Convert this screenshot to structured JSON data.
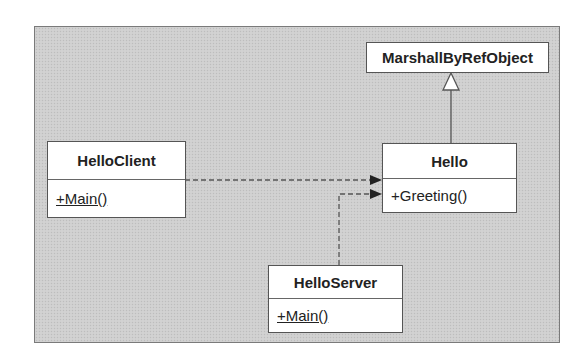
{
  "diagram": {
    "type": "uml-class-diagram",
    "background_color": "#cfcfcf",
    "classes": [
      {
        "id": "marshall",
        "name": "MarshallByRefObject",
        "operations": []
      },
      {
        "id": "hello",
        "name": "Hello",
        "operations": [
          {
            "label": "+Greeting()",
            "static": false
          }
        ]
      },
      {
        "id": "client",
        "name": "HelloClient",
        "operations": [
          {
            "label": "+Main()",
            "static": true
          }
        ]
      },
      {
        "id": "server",
        "name": "HelloServer",
        "operations": [
          {
            "label": "+Main()",
            "static": true
          }
        ]
      }
    ],
    "relationships": [
      {
        "from": "Hello",
        "to": "MarshallByRefObject",
        "kind": "generalization",
        "arrow": "hollow-triangle",
        "line": "solid"
      },
      {
        "from": "HelloClient",
        "to": "Hello",
        "kind": "dependency",
        "arrow": "filled",
        "line": "dashed"
      },
      {
        "from": "HelloServer",
        "to": "Hello",
        "kind": "dependency",
        "arrow": "filled",
        "line": "dashed"
      }
    ]
  }
}
